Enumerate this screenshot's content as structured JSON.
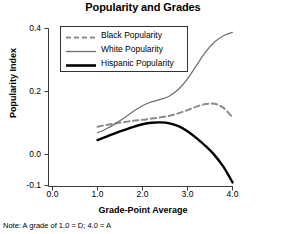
{
  "chart_data": {
    "type": "line",
    "title": "Popularity and Grades",
    "xlabel": "Grade-Point Average",
    "ylabel": "Popularity Index",
    "note": "Note: A grade of 1.0 = D; 4.0 = A",
    "xlim": [
      0.0,
      4.0
    ],
    "ylim": [
      -0.1,
      0.4
    ],
    "xticks": [
      "0.0",
      "1.0",
      "2.0",
      "3.0",
      "4.0"
    ],
    "xtick_values": [
      0.0,
      1.0,
      2.0,
      3.0,
      4.0
    ],
    "yticks": [
      "0.4",
      "0.2",
      "0.0",
      "-0.1"
    ],
    "ytick_values": [
      0.4,
      0.2,
      0.0,
      -0.1
    ],
    "grid": false,
    "legend_position": "upper-left",
    "x": [
      1.0,
      1.2,
      1.4,
      1.6,
      1.8,
      2.0,
      2.2,
      2.4,
      2.6,
      2.8,
      3.0,
      3.2,
      3.4,
      3.6,
      3.8,
      4.0
    ],
    "series": [
      {
        "name": "Black Popularity",
        "style": "dashed",
        "color": "#8c8c8c",
        "width": 2,
        "values": [
          0.088,
          0.094,
          0.099,
          0.103,
          0.107,
          0.11,
          0.114,
          0.118,
          0.123,
          0.131,
          0.141,
          0.152,
          0.16,
          0.161,
          0.148,
          0.118
        ]
      },
      {
        "name": "White Popularity",
        "style": "solid",
        "color": "#6e6e6e",
        "width": 1.2,
        "values": [
          0.069,
          0.082,
          0.098,
          0.117,
          0.137,
          0.155,
          0.167,
          0.175,
          0.186,
          0.207,
          0.24,
          0.283,
          0.325,
          0.357,
          0.377,
          0.388
        ]
      },
      {
        "name": "Hispanic Popularity",
        "style": "solid",
        "color": "#000000",
        "width": 2.4,
        "values": [
          0.046,
          0.057,
          0.068,
          0.078,
          0.088,
          0.096,
          0.101,
          0.102,
          0.099,
          0.09,
          0.074,
          0.052,
          0.027,
          -0.002,
          -0.04,
          -0.09
        ]
      }
    ]
  },
  "legend": {
    "items": [
      {
        "label": "Black Popularity"
      },
      {
        "label": "White Popularity"
      },
      {
        "label": "Hispanic Popularity"
      }
    ]
  },
  "axis_colors": {
    "axis_line": "#3a3a3a",
    "text": "#000000"
  }
}
